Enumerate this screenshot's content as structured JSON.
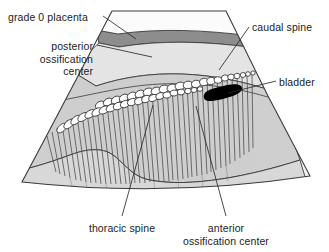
{
  "figure": {
    "type": "ultrasound-sector-illustration",
    "background_color": "#ffffff",
    "outline_color": "#3a3a3a"
  },
  "regions": {
    "amniotic_fluid": {
      "name": "amniotic fluid",
      "fill": "#f7f7f7"
    },
    "placenta_band": {
      "name": "grade 0 placenta",
      "fill": "#8d8d8d"
    },
    "subplacental": {
      "name": "subplacental tissue",
      "fill": "#e2e2e2"
    },
    "fetal_body": {
      "name": "fetal body",
      "fill": "#cfcfcf"
    },
    "lower_tissue": {
      "name": "lower tissue",
      "fill": "#d9d9d9"
    },
    "bladder": {
      "name": "bladder",
      "fill": "#000000"
    },
    "ossification_center": {
      "name": "ossification center",
      "fill": "#ffffff"
    },
    "acoustic_shadow": {
      "name": "acoustic shadow",
      "stroke": "#4a4a4a"
    }
  },
  "labels": [
    {
      "id": "grade-0-placenta",
      "lines": [
        "grade 0 placenta"
      ],
      "x": 8,
      "y": 11,
      "align": "left"
    },
    {
      "id": "posterior-ossification-center",
      "lines": [
        "posterior",
        "ossification",
        "center"
      ],
      "x": 93,
      "y": 40,
      "align": "right"
    },
    {
      "id": "caudal-spine",
      "lines": [
        "caudal spine"
      ],
      "x": 252,
      "y": 23,
      "align": "left"
    },
    {
      "id": "bladder",
      "lines": [
        "bladder"
      ],
      "x": 279,
      "y": 78,
      "align": "left"
    },
    {
      "id": "thoracic-spine",
      "lines": [
        "thoracic spine"
      ],
      "x": 122,
      "y": 224,
      "align": "center"
    },
    {
      "id": "anterior-ossification-center",
      "lines": [
        "anterior",
        "ossification center"
      ],
      "x": 221,
      "y": 224,
      "align": "center"
    }
  ],
  "label_text": {
    "grade_0_placenta": "grade 0 placenta",
    "posterior_l1": "posterior",
    "posterior_l2": "ossification",
    "posterior_l3": "center",
    "caudal_spine": "caudal spine",
    "bladder": "bladder",
    "thoracic_spine": "thoracic spine",
    "anterior_l1": "anterior",
    "anterior_l2": "ossification center"
  },
  "leader_lines": [
    {
      "id": "leader-grade-0-placenta",
      "from": [
        103,
        16
      ],
      "to": [
        135,
        38
      ]
    },
    {
      "id": "leader-posterior-ossification",
      "from": [
        97,
        45
      ],
      "to": [
        150,
        56
      ]
    },
    {
      "id": "leader-caudal-spine",
      "from": [
        249,
        27
      ],
      "to": [
        219,
        70
      ]
    },
    {
      "id": "leader-bladder",
      "from": [
        276,
        81
      ],
      "to": [
        228,
        93
      ]
    },
    {
      "id": "leader-thoracic-spine",
      "from": [
        122,
        217
      ],
      "to": [
        152,
        106
      ]
    },
    {
      "id": "leader-anterior-ossification",
      "from": [
        225,
        217
      ],
      "to": [
        196,
        107
      ]
    }
  ],
  "sector": {
    "top_left": [
      112,
      11
    ],
    "top_right": [
      226,
      11
    ],
    "bottom_left": [
      22,
      182
    ],
    "bottom_right": [
      310,
      176
    ]
  },
  "spine": {
    "upper_row_count": 22,
    "lower_row_count": 21,
    "shadow_streak_count": 44,
    "note": "two rows of bright ossification centers with acoustic shadowing beneath"
  }
}
